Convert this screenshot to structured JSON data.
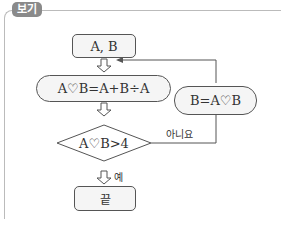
{
  "header": {
    "tag_label": "보기"
  },
  "flowchart": {
    "start_box": "A, B",
    "process_box": "A♡B=A+B÷A",
    "update_box": "B=A♡B",
    "decision": "A♡B>4",
    "yes_label": "예",
    "no_label": "아니요",
    "end_box": "끝"
  }
}
